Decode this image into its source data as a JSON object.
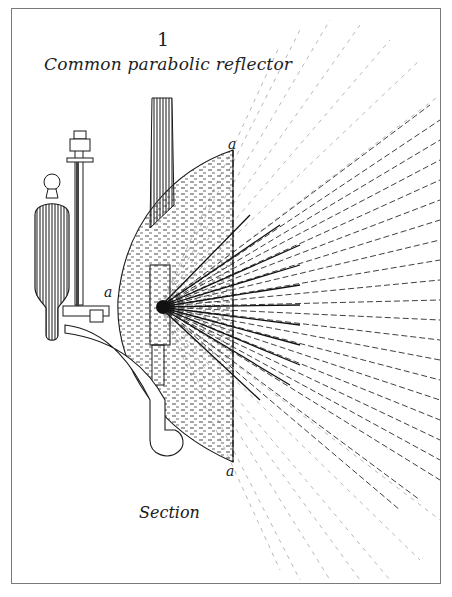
{
  "figure": {
    "number": "1",
    "title": "Common parabolic reflector",
    "caption": "Section",
    "labels": {
      "a_top": "a",
      "a_left": "a",
      "a_bottom": "a"
    }
  },
  "diagram": {
    "components": [
      {
        "name": "oil-reservoir",
        "shape": "capsule-vessel"
      },
      {
        "name": "feed-pipe",
        "shape": "vertical-tube-with-valve"
      },
      {
        "name": "chimney",
        "shape": "tapered-column"
      },
      {
        "name": "reflector",
        "shape": "parabolic-section"
      },
      {
        "name": "burner",
        "shape": "rectangular-wick-holder"
      },
      {
        "name": "support-arm",
        "shape": "curved-bracket"
      },
      {
        "name": "focal-axis-line",
        "shape": "vertical-line-a-a"
      },
      {
        "name": "light-rays",
        "shape": "radiating-fan"
      }
    ],
    "colors": {
      "ink": "#1a1a1a",
      "frame": "#7a7a7a",
      "paper": "#ffffff",
      "shading": "#3a3a3a",
      "ray_light": "#9a9a9a"
    }
  }
}
